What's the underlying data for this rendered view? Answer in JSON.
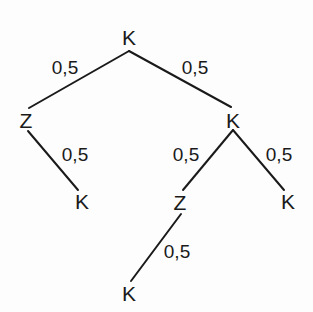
{
  "diagram": {
    "type": "probability-tree",
    "line_color": "#1a1a1a",
    "nodes": [
      {
        "id": "root",
        "text": "K",
        "x": 129,
        "y": 37
      },
      {
        "id": "l1-left",
        "text": "Z",
        "x": 26,
        "y": 120
      },
      {
        "id": "l1-right",
        "text": "K",
        "x": 233,
        "y": 120
      },
      {
        "id": "l2-left",
        "text": "K",
        "x": 82,
        "y": 201
      },
      {
        "id": "l2-mid",
        "text": "Z",
        "x": 180,
        "y": 202
      },
      {
        "id": "l2-right",
        "text": "K",
        "x": 288,
        "y": 201
      },
      {
        "id": "l3",
        "text": "K",
        "x": 129,
        "y": 293
      }
    ],
    "edges": [
      {
        "from": "root",
        "to": "l1-left",
        "label": "0,5",
        "x1": 129,
        "y1": 51,
        "x2": 29,
        "y2": 108,
        "lx": 65,
        "ly": 67
      },
      {
        "from": "root",
        "to": "l1-right",
        "label": "0,5",
        "x1": 129,
        "y1": 51,
        "x2": 231,
        "y2": 107,
        "lx": 195,
        "ly": 67
      },
      {
        "from": "l1-left",
        "to": "l2-left",
        "label": "0,5",
        "x1": 28,
        "y1": 131,
        "x2": 78,
        "y2": 190,
        "lx": 75,
        "ly": 154
      },
      {
        "from": "l1-right",
        "to": "l2-mid",
        "label": "0,5",
        "x1": 233,
        "y1": 130,
        "x2": 183,
        "y2": 190,
        "lx": 186,
        "ly": 154
      },
      {
        "from": "l1-right",
        "to": "l2-right",
        "label": "0,5",
        "x1": 233,
        "y1": 130,
        "x2": 284,
        "y2": 190,
        "lx": 279,
        "ly": 154
      },
      {
        "from": "l2-mid",
        "to": "l3",
        "label": "0,5",
        "x1": 181,
        "y1": 214,
        "x2": 131,
        "y2": 281,
        "lx": 177,
        "ly": 251
      }
    ]
  }
}
